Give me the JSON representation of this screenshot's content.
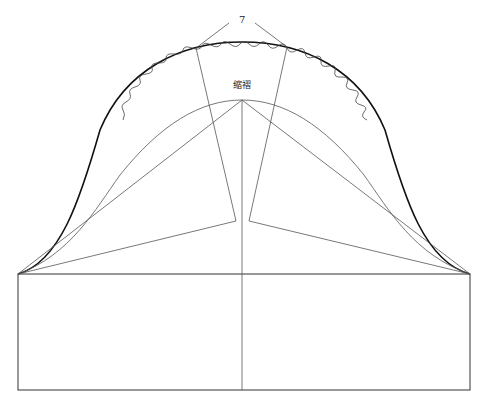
{
  "diagram": {
    "type": "sleeve-cap-pattern",
    "labels": {
      "measurement": "7",
      "gathering": "缩褶"
    },
    "colors": {
      "outline": "#111111",
      "construction": "#555555",
      "background": "#ffffff"
    },
    "rectangle": {
      "x1": 18,
      "y1": 274,
      "x2": 470,
      "y2": 390
    },
    "center_line_x": 242,
    "apex": {
      "x": 242,
      "y": 100
    },
    "dart_tips": [
      {
        "x": 236,
        "y": 221
      },
      {
        "x": 249,
        "y": 221
      }
    ]
  }
}
